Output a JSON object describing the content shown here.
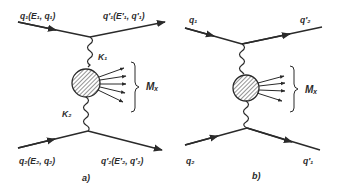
{
  "diagram_a": {
    "caption": "a)",
    "incoming_top": "q₁(E₁, q₁)",
    "outgoing_top": "q′₁(E′₁, q′₁)",
    "incoming_bottom": "q₂(E₂, q₂)",
    "outgoing_bottom": "q′₂(E′₂, q′₂)",
    "photon_top": "K₁",
    "photon_bottom": "K₂",
    "final_state": "Mₓ"
  },
  "diagram_b": {
    "caption": "b)",
    "incoming_top": "q₁",
    "outgoing_top": "q′₂",
    "incoming_bottom": "q₂",
    "outgoing_bottom": "q′₁",
    "final_state": "Mₓ"
  },
  "colors": {
    "ink": "#2a2a2a",
    "background": "#ffffff"
  }
}
